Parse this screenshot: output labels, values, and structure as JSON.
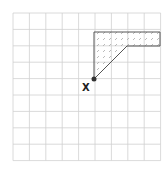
{
  "diagram": {
    "grid": {
      "cols": 9,
      "rows": 9,
      "x0": 13,
      "y0": 13,
      "cell": 16.4,
      "line_color": "#d0d0d0"
    },
    "shape": {
      "points": [
        [
          94,
          79
        ],
        [
          94,
          32
        ],
        [
          160,
          32
        ],
        [
          160,
          46
        ],
        [
          127,
          46
        ]
      ],
      "fill": "hatched",
      "stroke": "#555555"
    },
    "point": {
      "x": 94,
      "y": 79,
      "label": "X"
    }
  }
}
